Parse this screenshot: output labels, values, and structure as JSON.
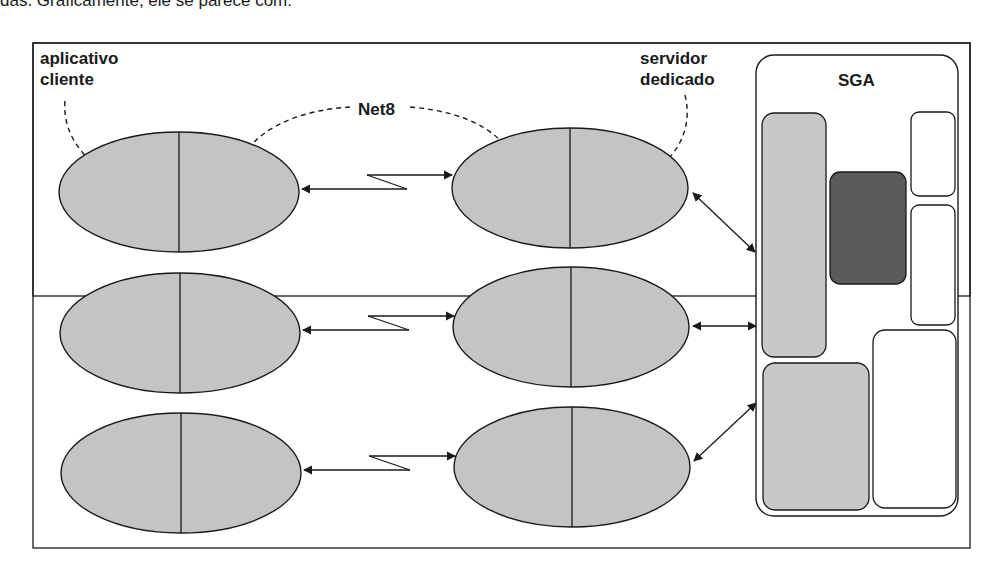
{
  "page": {
    "cropped_text_above": "das. Graficamente, ele se parece com:"
  },
  "diagram": {
    "labels": {
      "client_app": [
        "aplicativo",
        "cliente"
      ],
      "network": "Net8",
      "dedicated_server": [
        "servidor",
        "dedicado"
      ],
      "sga": "SGA"
    },
    "rows": [
      {
        "client": "client-process-1",
        "server": "server-process-1"
      },
      {
        "client": "client-process-2",
        "server": "server-process-2"
      },
      {
        "client": "client-process-3",
        "server": "server-process-3"
      }
    ],
    "colors": {
      "ellipse_fill": "#c4c4c4",
      "sga_light_block": "#c8c8c8",
      "sga_dark_block": "#5a5a5a",
      "stroke": "#1a1a1a",
      "background": "#ffffff"
    }
  }
}
